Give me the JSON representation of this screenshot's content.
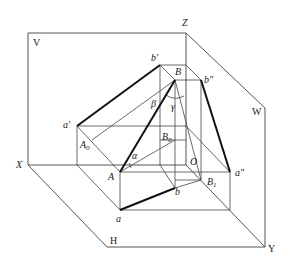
{
  "planes": {
    "V": "V",
    "H": "H",
    "W": "W"
  },
  "axes": {
    "X": "X",
    "Y": "Y",
    "Z": "Z",
    "O": "O"
  },
  "points": {
    "a_prime": "a′",
    "b_prime": "b′",
    "b_double_prime": "b″",
    "a_double_prime": "a″",
    "A": "A",
    "B": "B",
    "a": "a",
    "b": "b",
    "A0": "A",
    "A0_sub": "0",
    "B0": "B",
    "B0_sub": "0",
    "B1": "B",
    "B1_sub": "1"
  },
  "angles": {
    "alpha": "α",
    "beta": "β",
    "gamma": "γ"
  },
  "colors": {
    "line": "#444444",
    "thick_line": "#111111",
    "background": "#ffffff"
  }
}
